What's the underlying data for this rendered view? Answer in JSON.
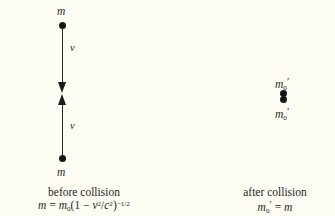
{
  "figure": {
    "type": "physics-diagram",
    "background_color": "#fdfdf4",
    "ink_color": "#1d1d1d"
  },
  "before": {
    "top_mass_label": "m",
    "top_velocity_label": "v",
    "bottom_velocity_label": "v",
    "bottom_mass_label": "m",
    "caption": "before collision",
    "formula": {
      "lhs": "m",
      "equals": "=",
      "rest_mass": "m",
      "rest_mass_subscript": "0",
      "open_paren": "(",
      "one": "1",
      "minus": "−",
      "v": "v",
      "v_exponent": "2",
      "slash": "/",
      "c": "c",
      "c_exponent": "2",
      "close_paren": ")",
      "outer_exponent": "−1/2"
    },
    "arrows": {
      "upper": "arrow-down",
      "lower": "arrow-up",
      "direction_note": "converging head-on"
    }
  },
  "after": {
    "top_mass_label_base": "m",
    "top_mass_subscript": "0",
    "top_mass_prime": "′",
    "bottom_mass_label_base": "m",
    "bottom_mass_subscript": "0",
    "bottom_mass_prime": "′",
    "caption": "after collision",
    "formula": {
      "lhs_base": "m",
      "lhs_subscript": "0",
      "lhs_prime": "′",
      "equals": "=",
      "rhs": "m"
    }
  }
}
